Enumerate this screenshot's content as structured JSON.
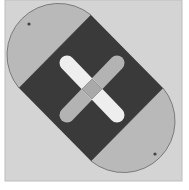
{
  "diagram": {
    "title": "",
    "colors": {
      "page_background": "#ffffff",
      "panel": "#d4d4d4",
      "panel_border": "#bdbdbd",
      "caps": "#b9b9b9",
      "cap_outline": "#7a7a7a",
      "square": "#3a3a3a",
      "bar_light": "#eeeeee",
      "bar_gray": "#b3b3b3",
      "center": "#a9a9a9",
      "dot": "#444444"
    },
    "shapes": {
      "panel": {
        "x": 5,
        "y": 0,
        "w": 177,
        "h": 181
      },
      "square": {
        "points": [
          [
            91,
            15
          ],
          [
            163,
            88
          ],
          [
            91,
            161
          ],
          [
            19,
            88
          ]
        ]
      },
      "cap_top_left": {
        "from": [
          19,
          88
        ],
        "to": [
          91,
          15
        ]
      },
      "cap_bottom_right": {
        "from": [
          163,
          88
        ],
        "to": [
          91,
          161
        ]
      },
      "dots": [
        [
          29,
          24
        ],
        [
          155,
          154
        ]
      ],
      "bar_light": {
        "from": [
          67,
          63
        ],
        "to": [
          117,
          115
        ],
        "width": 15
      },
      "bar_gray": {
        "from": [
          117,
          63
        ],
        "to": [
          67,
          115
        ],
        "width": 15
      },
      "center_diamond": {
        "cx": 91,
        "cy": 89,
        "r": 10
      }
    }
  }
}
